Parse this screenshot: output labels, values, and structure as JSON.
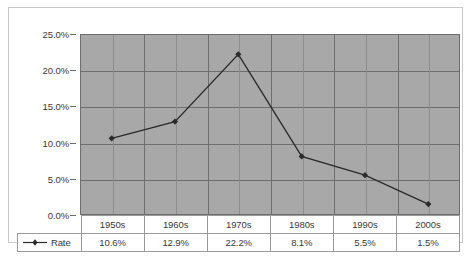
{
  "chart_data": {
    "type": "line",
    "title": "",
    "xlabel": "",
    "ylabel": "",
    "categories": [
      "1950s",
      "1960s",
      "1970s",
      "1980s",
      "1990s",
      "2000s"
    ],
    "series": [
      {
        "name": "Rate",
        "values": [
          10.6,
          12.9,
          22.2,
          8.1,
          5.5,
          1.5
        ],
        "value_labels": [
          "10.6%",
          "12.9%",
          "22.2%",
          "8.1%",
          "5.5%",
          "1.5%"
        ],
        "marker": "diamond",
        "color": "#2b2b2b"
      }
    ],
    "ylim": [
      0,
      25
    ],
    "ytick_values": [
      0,
      5,
      10,
      15,
      20,
      25
    ],
    "ytick_labels": [
      "0.0%",
      "5.0%",
      "10.0%",
      "15.0%",
      "20.0%",
      "25.0%"
    ],
    "grid": true,
    "legend_position": "bottom-left-table",
    "plot_background": "#a8a8a8",
    "grid_color": "#6e6e6e",
    "has_data_table": true
  },
  "legend": {
    "series_label": "Rate",
    "marker_icon": "line-with-diamond-marker"
  },
  "table": {
    "category_row": [
      "1950s",
      "1960s",
      "1970s",
      "1980s",
      "1990s",
      "2000s"
    ],
    "value_row": [
      "10.6%",
      "12.9%",
      "22.2%",
      "8.1%",
      "5.5%",
      "1.5%"
    ]
  }
}
